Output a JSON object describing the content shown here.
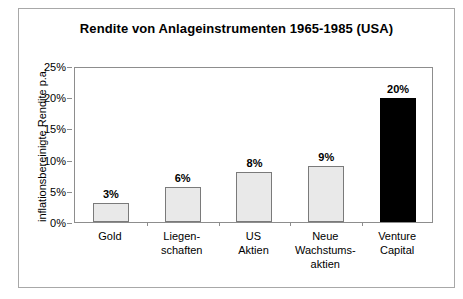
{
  "chart_data": {
    "type": "bar",
    "title": "Rendite von Anlageinstrumenten 1965-1985 (USA)",
    "xlabel": "",
    "ylabel": "inflationsbereinigte Rendite p.a.",
    "categories": [
      [
        "Gold"
      ],
      [
        "Liegen-",
        "schaften"
      ],
      [
        "US",
        "Aktien"
      ],
      [
        "Neue",
        "Wachstums-",
        "aktien"
      ],
      [
        "Venture",
        "Capital"
      ]
    ],
    "category_names": [
      "Gold",
      "Liegenschaften",
      "US Aktien",
      "Neue Wachstumsaktien",
      "Venture Capital"
    ],
    "values": [
      3,
      5.6,
      8,
      9,
      19.8
    ],
    "data_labels": [
      "3%",
      "6%",
      "8%",
      "9%",
      "20%"
    ],
    "highlight_index": 4,
    "ylim": [
      0,
      25
    ],
    "ytick_values": [
      0,
      5,
      10,
      15,
      20,
      25
    ],
    "ytick_labels": [
      "0%",
      "5%",
      "10%",
      "15%",
      "20%",
      "25%"
    ],
    "grid": false,
    "legend": "none",
    "colors": {
      "bar_fill": "#e9e9e9",
      "bar_border": "#7a7a7a",
      "highlight_fill": "#000000",
      "axis": "#8d8d8d",
      "text": "#000000",
      "frame": "#a8a8a8",
      "background": "#ffffff"
    }
  }
}
